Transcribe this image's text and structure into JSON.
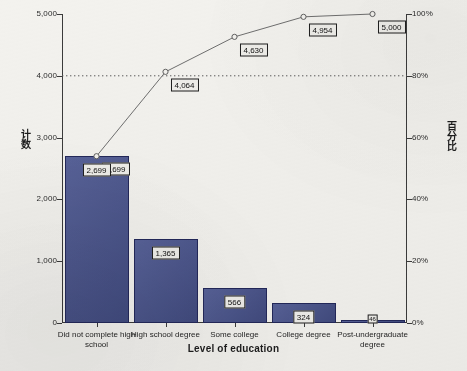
{
  "chart_data": {
    "type": "bar",
    "title": "",
    "xlabel": "Level of education",
    "ylabel": "计数",
    "y2label": "百分比",
    "categories": [
      "Did not complete high school",
      "High school degree",
      "Some college",
      "College degree",
      "Post-undergraduate degree"
    ],
    "values": [
      2699,
      1365,
      566,
      324,
      46
    ],
    "value_labels": [
      "2,699",
      "1,365",
      "566",
      "324",
      "46"
    ],
    "cumulative": [
      2699,
      4064,
      4630,
      4954,
      5000
    ],
    "cumulative_labels": [
      "2,699",
      "4,064",
      "4,630",
      "4,954",
      "5,000"
    ],
    "cumulative_percent": [
      54.0,
      81.3,
      92.6,
      99.1,
      100.0
    ],
    "ylim": [
      0,
      5000
    ],
    "yticks": [
      0,
      1000,
      2000,
      3000,
      4000,
      5000
    ],
    "ytick_labels": [
      "0",
      "1,000",
      "2,000",
      "3,000",
      "4,000",
      "5,000"
    ],
    "y2lim": [
      0,
      100
    ],
    "y2ticks": [
      0,
      20,
      40,
      60,
      80,
      100
    ],
    "y2tick_labels": [
      "0%",
      "20%",
      "40%",
      "60%",
      "80%",
      "100%"
    ],
    "reference_line": {
      "value": 80,
      "axis": "percent",
      "style": "dotted"
    },
    "grid": false,
    "legend": null,
    "series": [
      {
        "name": "计数",
        "type": "bar",
        "values": [
          2699,
          1365,
          566,
          324,
          46
        ]
      },
      {
        "name": "百分比",
        "type": "line",
        "values": [
          2699,
          4064,
          4630,
          4954,
          5000
        ]
      }
    ],
    "colors": {
      "bar_fill": "#4a5590",
      "bar_stroke": "#23285a",
      "line": "#6f6f6f",
      "reference_line": "#5a5a5a",
      "axis": "#3b3b3b",
      "background": "#f3f2ee"
    }
  },
  "axes": {
    "x_title": "Level of education",
    "y_left_title": "计数",
    "y_right_title": "百分比"
  }
}
